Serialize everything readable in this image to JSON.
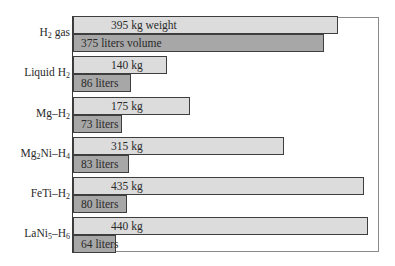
{
  "chart_data": {
    "type": "bar",
    "orientation": "horizontal",
    "title": "",
    "xlabel": "",
    "ylabel": "",
    "grid": false,
    "legend": "none (values labeled inside bars)",
    "categories": [
      "H2 gas",
      "Liquid H2",
      "Mg–H2",
      "Mg2Ni–H4",
      "FeTi–H2",
      "LaNi5–H6"
    ],
    "category_display": [
      {
        "base": "H",
        "sub": "2",
        "rest": " gas",
        "tail": "",
        "tail_sub": ""
      },
      {
        "base": "Liquid H",
        "sub": "2",
        "rest": "",
        "tail": "",
        "tail_sub": ""
      },
      {
        "base": "Mg–H",
        "sub": "2",
        "rest": "",
        "tail": "",
        "tail_sub": ""
      },
      {
        "base": "Mg",
        "sub": "2",
        "rest": "Ni–H",
        "tail": "",
        "tail_sub": "4"
      },
      {
        "base": "FeTi–H",
        "sub": "2",
        "rest": "",
        "tail": "",
        "tail_sub": ""
      },
      {
        "base": "LaNi",
        "sub": "5",
        "rest": "–H",
        "tail": "",
        "tail_sub": "6"
      }
    ],
    "series": [
      {
        "name": "Weight (kg)",
        "color": "#dcdcdc",
        "values": [
          395,
          140,
          175,
          315,
          435,
          440
        ],
        "labels": [
          "395 kg weight",
          "140 kg",
          "175 kg",
          "315 kg",
          "435 kg",
          "440 kg"
        ]
      },
      {
        "name": "Volume (liters)",
        "color": "#a7a7a7",
        "values": [
          375,
          86,
          73,
          83,
          80,
          64
        ],
        "labels": [
          "375 liters volume",
          "86 liters",
          "73 liters",
          "83 liters",
          "80 liters",
          "64 liters"
        ]
      }
    ]
  }
}
